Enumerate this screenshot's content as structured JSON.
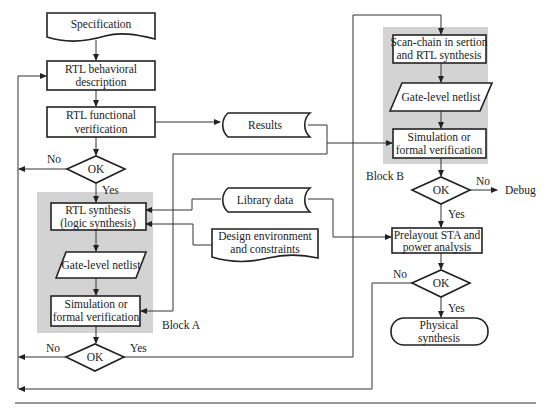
{
  "diagram": {
    "type": "flowchart",
    "nodes": {
      "specification": "Specification",
      "rtl_behavioral": [
        "RTL behavioral",
        "description"
      ],
      "rtl_functional": [
        "RTL functional",
        "verification"
      ],
      "ok1": "OK",
      "rtl_synthesis": [
        "RTL synthesis",
        "(logic synthesis)"
      ],
      "gate_netlist_a": "Gate-level netlist",
      "simulation_a": [
        "Simulation or",
        "formal verification"
      ],
      "ok2": "OK",
      "results": "Results",
      "library_data": "Library data",
      "design_env": [
        "Design environment",
        "and constraints"
      ],
      "scan_chain": [
        "Scan-chain in sertion",
        "and RTL synthesis"
      ],
      "gate_netlist_b": "Gate-level netlist",
      "simulation_b": [
        "Simulation or",
        "formal verification"
      ],
      "ok_b": "OK",
      "debug": "Debug",
      "prelayout": [
        "Prelayout STA and",
        "power analysis"
      ],
      "ok_c": "OK",
      "physical_synthesis": [
        "Physical",
        "synthesis"
      ]
    },
    "labels": {
      "no": "No",
      "yes": "Yes",
      "block_a": "Block A",
      "block_b": "Block B"
    },
    "colors": {
      "block_fill": "#d3d3d3",
      "line": "#333333"
    },
    "edges": [
      {
        "from": "specification",
        "to": "rtl_behavioral"
      },
      {
        "from": "rtl_behavioral",
        "to": "rtl_functional"
      },
      {
        "from": "rtl_functional",
        "to": "ok1"
      },
      {
        "from": "rtl_functional",
        "to": "results"
      },
      {
        "from": "ok1",
        "to": "rtl_behavioral",
        "label": "No"
      },
      {
        "from": "ok1",
        "to": "rtl_synthesis",
        "label": "Yes"
      },
      {
        "from": "library_data",
        "to": "rtl_synthesis"
      },
      {
        "from": "design_env",
        "to": "rtl_synthesis"
      },
      {
        "from": "rtl_synthesis",
        "to": "gate_netlist_a"
      },
      {
        "from": "gate_netlist_a",
        "to": "simulation_a"
      },
      {
        "from": "results",
        "to": "simulation_a"
      },
      {
        "from": "results",
        "to": "simulation_b"
      },
      {
        "from": "simulation_a",
        "to": "ok2"
      },
      {
        "from": "ok2",
        "to": "rtl_behavioral",
        "label": "No"
      },
      {
        "from": "ok2",
        "to": "scan_chain",
        "label": "Yes"
      },
      {
        "from": "scan_chain",
        "to": "gate_netlist_b"
      },
      {
        "from": "gate_netlist_b",
        "to": "simulation_b"
      },
      {
        "from": "simulation_b",
        "to": "ok_b"
      },
      {
        "from": "ok_b",
        "to": "debug",
        "label": "No"
      },
      {
        "from": "ok_b",
        "to": "prelayout",
        "label": "Yes"
      },
      {
        "from": "library_data",
        "to": "prelayout"
      },
      {
        "from": "prelayout",
        "to": "ok_c"
      },
      {
        "from": "ok_c",
        "to": "rtl_behavioral",
        "label": "No"
      },
      {
        "from": "ok_c",
        "to": "physical_synthesis",
        "label": "Yes"
      }
    ]
  }
}
